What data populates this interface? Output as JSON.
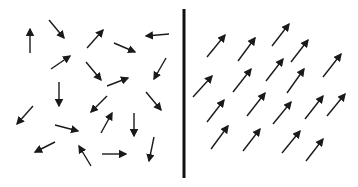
{
  "diagram": {
    "colors": {
      "arrow": "#1a1a1a",
      "divider": "#111111",
      "background": "#ffffff"
    },
    "divider": {
      "x": 184,
      "y1": 9,
      "y2": 178,
      "width": 3
    },
    "left_panel": {
      "label": "",
      "orientation": "random",
      "arrows": [
        {
          "x1": 30,
          "y1": 53,
          "x2": 30,
          "y2": 29
        },
        {
          "x1": 49,
          "y1": 20,
          "x2": 64,
          "y2": 38
        },
        {
          "x1": 87,
          "y1": 48,
          "x2": 103,
          "y2": 30
        },
        {
          "x1": 169,
          "y1": 34,
          "x2": 146,
          "y2": 36
        },
        {
          "x1": 114,
          "y1": 43,
          "x2": 135,
          "y2": 52
        },
        {
          "x1": 51,
          "y1": 69,
          "x2": 70,
          "y2": 56
        },
        {
          "x1": 86,
          "y1": 62,
          "x2": 101,
          "y2": 80
        },
        {
          "x1": 107,
          "y1": 86,
          "x2": 128,
          "y2": 78
        },
        {
          "x1": 166,
          "y1": 58,
          "x2": 154,
          "y2": 79
        },
        {
          "x1": 59,
          "y1": 82,
          "x2": 59,
          "y2": 106
        },
        {
          "x1": 107,
          "y1": 96,
          "x2": 91,
          "y2": 112
        },
        {
          "x1": 146,
          "y1": 92,
          "x2": 161,
          "y2": 110
        },
        {
          "x1": 33,
          "y1": 106,
          "x2": 17,
          "y2": 124
        },
        {
          "x1": 55,
          "y1": 125,
          "x2": 78,
          "y2": 131
        },
        {
          "x1": 101,
          "y1": 133,
          "x2": 112,
          "y2": 113
        },
        {
          "x1": 134,
          "y1": 113,
          "x2": 134,
          "y2": 136
        },
        {
          "x1": 55,
          "y1": 142,
          "x2": 35,
          "y2": 152
        },
        {
          "x1": 91,
          "y1": 166,
          "x2": 79,
          "y2": 146
        },
        {
          "x1": 102,
          "y1": 154,
          "x2": 126,
          "y2": 154
        },
        {
          "x1": 154,
          "y1": 137,
          "x2": 149,
          "y2": 161
        }
      ]
    },
    "right_panel": {
      "label": "",
      "orientation": "aligned-up-right",
      "arrows": [
        {
          "x1": 207,
          "y1": 57,
          "x2": 225,
          "y2": 35
        },
        {
          "x1": 238,
          "y1": 61,
          "x2": 255,
          "y2": 38
        },
        {
          "x1": 272,
          "y1": 46,
          "x2": 289,
          "y2": 24
        },
        {
          "x1": 291,
          "y1": 62,
          "x2": 308,
          "y2": 40
        },
        {
          "x1": 323,
          "y1": 77,
          "x2": 341,
          "y2": 54
        },
        {
          "x1": 193,
          "y1": 97,
          "x2": 212,
          "y2": 76
        },
        {
          "x1": 233,
          "y1": 92,
          "x2": 251,
          "y2": 69
        },
        {
          "x1": 266,
          "y1": 81,
          "x2": 283,
          "y2": 59
        },
        {
          "x1": 287,
          "y1": 93,
          "x2": 304,
          "y2": 69
        },
        {
          "x1": 207,
          "y1": 122,
          "x2": 224,
          "y2": 100
        },
        {
          "x1": 247,
          "y1": 116,
          "x2": 265,
          "y2": 93
        },
        {
          "x1": 273,
          "y1": 124,
          "x2": 291,
          "y2": 102
        },
        {
          "x1": 305,
          "y1": 119,
          "x2": 323,
          "y2": 96
        },
        {
          "x1": 327,
          "y1": 116,
          "x2": 345,
          "y2": 94
        },
        {
          "x1": 211,
          "y1": 149,
          "x2": 228,
          "y2": 126
        },
        {
          "x1": 243,
          "y1": 151,
          "x2": 260,
          "y2": 129
        },
        {
          "x1": 282,
          "y1": 153,
          "x2": 300,
          "y2": 131
        },
        {
          "x1": 306,
          "y1": 161,
          "x2": 323,
          "y2": 139
        }
      ]
    }
  }
}
